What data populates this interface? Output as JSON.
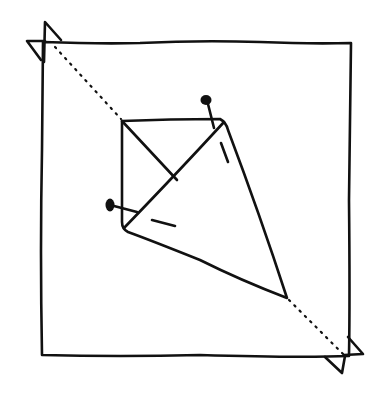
{
  "diagram": {
    "ink_color": "#111111",
    "background": "#ffffff",
    "outer_square": {
      "points": [
        [
          43,
          42
        ],
        [
          351,
          43
        ],
        [
          349,
          356
        ],
        [
          42,
          355
        ]
      ]
    },
    "corner_flaps": [
      {
        "name": "top-left",
        "paths": [
          [
            [
              42,
              62
            ],
            [
              42,
              22
            ],
            [
              61,
              40
            ]
          ],
          [
            [
              41,
              60
            ],
            [
              27,
              40
            ],
            [
              45,
              41
            ]
          ]
        ]
      },
      {
        "name": "bottom-right",
        "paths": [
          [
            [
              349,
              337
            ],
            [
              364,
              354
            ],
            [
              344,
              355
            ]
          ],
          [
            [
              325,
              357
            ],
            [
              343,
              372
            ],
            [
              345,
              356
            ]
          ]
        ]
      }
    ],
    "fold_line": {
      "style": "dotted",
      "segments": [
        [
          [
            55,
            47
          ],
          [
            121,
            119
          ]
        ],
        [
          [
            288,
            300
          ],
          [
            344,
            355
          ]
        ]
      ]
    },
    "kite": {
      "outline": [
        [
          122,
          121
        ],
        [
          222,
          119
        ],
        [
          287,
          298
        ],
        [
          124,
          229
        ]
      ],
      "inner_diagonal_a": [
        [
          122,
          121
        ],
        [
          177,
          180
        ]
      ],
      "inner_diagonal_b": [
        [
          222,
          119
        ],
        [
          124,
          229
        ]
      ]
    },
    "pins": [
      {
        "name": "top-pin",
        "head": [
          206,
          100
        ],
        "shaft_end": [
          215,
          128
        ]
      },
      {
        "name": "left-pin",
        "head": [
          110,
          205
        ],
        "shaft_end": [
          137,
          212
        ]
      }
    ],
    "fold_dashes": [
      [
        [
          221,
          143
        ],
        [
          228,
          162
        ]
      ],
      [
        [
          152,
          220
        ],
        [
          175,
          226
        ]
      ]
    ]
  }
}
